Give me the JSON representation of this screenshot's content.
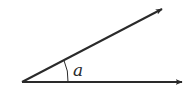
{
  "diagram": {
    "type": "angle",
    "angle_label": "a",
    "vertex": [
      22,
      82
    ],
    "ray_upper_tip": [
      164,
      8
    ],
    "ray_lower_tip": [
      184,
      82
    ],
    "stroke_color": "#2a2a2a",
    "background": "#ffffff"
  }
}
